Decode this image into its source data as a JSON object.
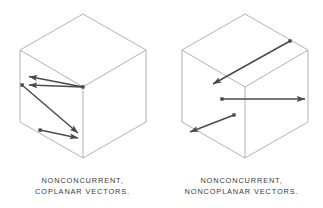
{
  "figure": {
    "background_color": "#ffffff",
    "cube_edge_color": "#a8a8a8",
    "vector_color": "#4a4a4a",
    "caption_color": "#3a3a3a"
  },
  "panels": [
    {
      "id": "left",
      "name": "nonconcurrent-coplanar",
      "caption_line1": "NONCONCURRENT,",
      "caption_line2": "COPLANAR  VECTORS.",
      "cube": {
        "type": "isometric-cube",
        "vertices": {
          "top_apex": [
            83,
            14
          ],
          "top_left": [
            20,
            50
          ],
          "top_right": [
            146,
            50
          ],
          "center_front": [
            83,
            87
          ],
          "bottom_left": [
            20,
            122
          ],
          "bottom_front": [
            83,
            158
          ],
          "bottom_right": [
            146,
            122
          ]
        }
      },
      "vectors": [
        {
          "name": "vector-1",
          "from": [
            83,
            87
          ],
          "to": [
            22,
            76
          ],
          "direction": "left-up",
          "plane": "front-left-face"
        },
        {
          "name": "vector-2",
          "from": [
            83,
            87
          ],
          "to": [
            22,
            85
          ],
          "direction": "left",
          "plane": "front-left-face"
        },
        {
          "name": "vector-3",
          "from": [
            22,
            85
          ],
          "to": [
            83,
            137
          ],
          "direction": "right-down",
          "plane": "front-left-face"
        },
        {
          "name": "vector-4",
          "from": [
            40,
            130
          ],
          "to": [
            83,
            139
          ],
          "direction": "right-down",
          "plane": "front-left-face"
        }
      ],
      "vector_count": 4,
      "coplanar": true,
      "concurrent": false
    },
    {
      "id": "right",
      "name": "nonconcurrent-noncoplanar",
      "caption_line1": "NONCONCURRENT,",
      "caption_line2": "NONCOPLANAR  VECTORS.",
      "cube": {
        "type": "isometric-cube",
        "vertices": {
          "top_apex": [
            245,
            14
          ],
          "top_left": [
            182,
            50
          ],
          "top_right": [
            308,
            50
          ],
          "center_front": [
            245,
            87
          ],
          "bottom_left": [
            182,
            122
          ],
          "bottom_front": [
            245,
            158
          ],
          "bottom_right": [
            308,
            122
          ]
        }
      },
      "vectors": [
        {
          "name": "vector-1",
          "from": [
            290,
            41
          ],
          "to": [
            207,
            87
          ],
          "direction": "down-left",
          "plane": "top-face"
        },
        {
          "name": "vector-2",
          "from": [
            222,
            99
          ],
          "to": [
            311,
            99
          ],
          "direction": "right",
          "plane": "right-face"
        },
        {
          "name": "vector-3",
          "from": [
            234,
            115
          ],
          "to": [
            188,
            133
          ],
          "direction": "down-left",
          "plane": "left-face"
        }
      ],
      "vector_count": 3,
      "coplanar": false,
      "concurrent": false
    }
  ]
}
